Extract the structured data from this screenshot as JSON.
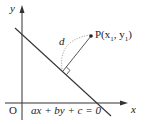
{
  "diagram": {
    "axes": {
      "x_label": "x",
      "y_label": "y",
      "origin_label": "O"
    },
    "line": {
      "equation": "ax + by + c = 0"
    },
    "point": {
      "label": "P(x",
      "sub1": "1",
      "mid": ", y",
      "sub2": "1",
      "end": ")"
    },
    "distance": {
      "label": "d"
    },
    "colors": {
      "line": "#333333",
      "dotted_arc": "#888888",
      "text": "#222222"
    }
  }
}
